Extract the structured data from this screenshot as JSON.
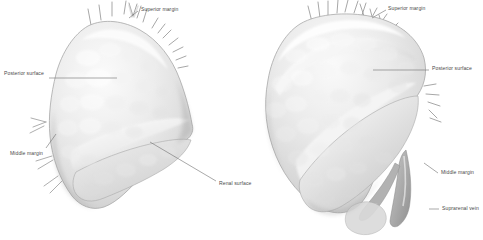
{
  "figure": {
    "background_color": "#ffffff",
    "gland_fill_light": "#f2f2f2",
    "gland_fill_mid": "#dcdcdc",
    "gland_fill_shadow": "#b4b4b4",
    "vessel_color": "#9a9a9a",
    "leader_line_color": "#6e6e6e",
    "label_text_color": "#4a4a4a"
  },
  "panels": [
    {
      "id": "left-panel",
      "name": "left-suprarenal-gland-anterior-view",
      "caption": ""
    },
    {
      "id": "right-panel",
      "name": "right-suprarenal-gland-posterior-view",
      "caption": ""
    }
  ],
  "annotations": [
    {
      "id": "left-superior-margin",
      "label": "Superior margin",
      "panel": "left-panel",
      "text_x": 141,
      "text_y": 7
    },
    {
      "id": "left-posterior-surface",
      "label": "Posterior surface",
      "panel": "left-panel",
      "text_x": 4,
      "text_y": 71
    },
    {
      "id": "left-middle-margin",
      "label": "Middle margin",
      "panel": "left-panel",
      "text_x": 10,
      "text_y": 151
    },
    {
      "id": "left-renal-surface",
      "label": "Renal surface",
      "panel": "left-panel",
      "text_x": 219,
      "text_y": 181
    },
    {
      "id": "right-superior-margin",
      "label": "Superior margin",
      "panel": "right-panel",
      "text_x": 388,
      "text_y": 6
    },
    {
      "id": "right-posterior-surface",
      "label": "Posterior surface",
      "panel": "right-panel",
      "text_x": 432,
      "text_y": 66
    },
    {
      "id": "right-middle-margin",
      "label": "Middle margin",
      "panel": "right-panel",
      "text_x": 441,
      "text_y": 170
    },
    {
      "id": "right-suprarenal-vein",
      "label": "Suprarenal vein",
      "panel": "right-panel",
      "text_x": 442,
      "text_y": 206
    }
  ]
}
